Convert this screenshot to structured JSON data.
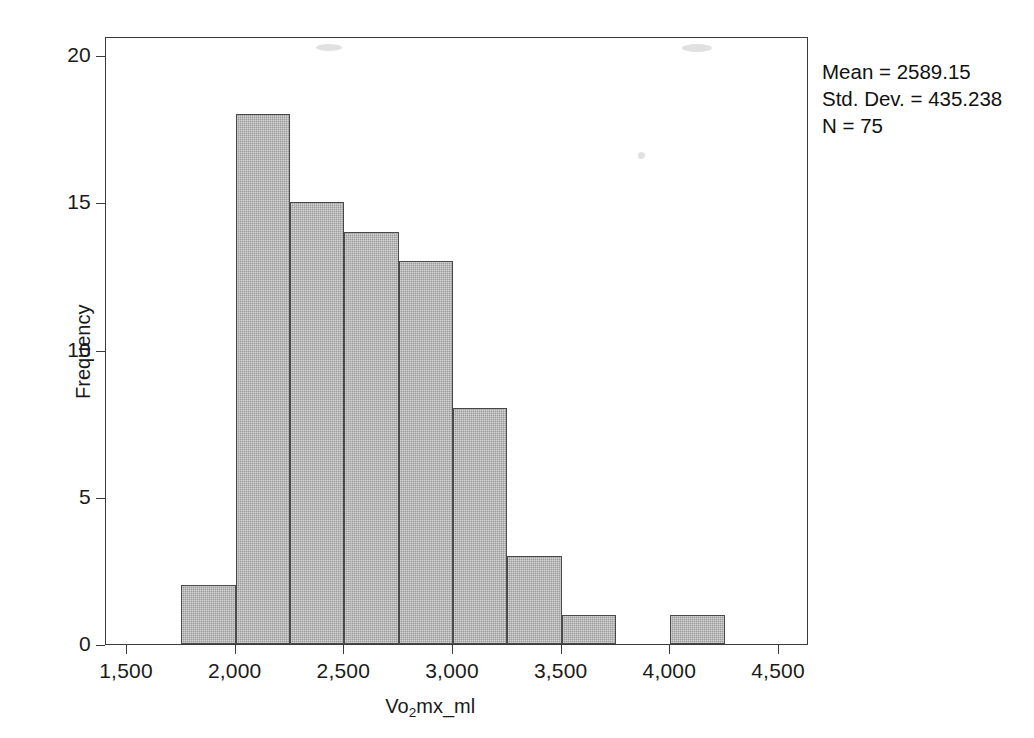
{
  "chart_data": {
    "type": "bar",
    "title": "",
    "subtitle": "",
    "xlabel": "Vo2mx_ml",
    "xlabel_parts": {
      "pre": "Vo",
      "sub": "2",
      "post": "mx_ml"
    },
    "ylabel": "Frequency",
    "xlim": [
      1300,
      4720
    ],
    "ylim": [
      0,
      21
    ],
    "grid": false,
    "legend_position": "outside-top-right",
    "bin_width": 250,
    "x_ticks": [
      1500,
      2000,
      2500,
      3000,
      3500,
      4000,
      4500
    ],
    "x_tick_labels": [
      "1,500",
      "2,000",
      "2,500",
      "3,000",
      "3,500",
      "4,000",
      "4,500"
    ],
    "y_ticks": [
      0,
      5,
      10,
      15,
      20
    ],
    "y_tick_labels": [
      "0",
      "5",
      "10",
      "15",
      "20"
    ],
    "bins": [
      {
        "start": 1750,
        "end": 2000,
        "value": 2
      },
      {
        "start": 2000,
        "end": 2250,
        "value": 18
      },
      {
        "start": 2250,
        "end": 2500,
        "value": 15
      },
      {
        "start": 2500,
        "end": 2750,
        "value": 14
      },
      {
        "start": 2750,
        "end": 3000,
        "value": 13
      },
      {
        "start": 3000,
        "end": 3250,
        "value": 8
      },
      {
        "start": 3250,
        "end": 3500,
        "value": 3
      },
      {
        "start": 3500,
        "end": 3750,
        "value": 1
      },
      {
        "start": 4000,
        "end": 4250,
        "value": 1
      }
    ],
    "categories": [
      "1750-2000",
      "2000-2250",
      "2250-2500",
      "2500-2750",
      "2750-3000",
      "3000-3250",
      "3250-3500",
      "3500-3750",
      "4000-4250"
    ],
    "values": [
      2,
      18,
      15,
      14,
      13,
      8,
      3,
      1,
      1
    ],
    "bar_fill_color": "#9d9d9d",
    "bar_border_color": "#4a4a4a",
    "axis_color": "#3b3b3b",
    "background_color": "#ffffff"
  },
  "stats": {
    "mean_line": "Mean = 2589.15",
    "std_dev_line": "Std. Dev. = 435.238",
    "n_line": "N = 75",
    "mean_value": 2589.15,
    "std_dev_value": 435.238,
    "n_value": 75
  }
}
